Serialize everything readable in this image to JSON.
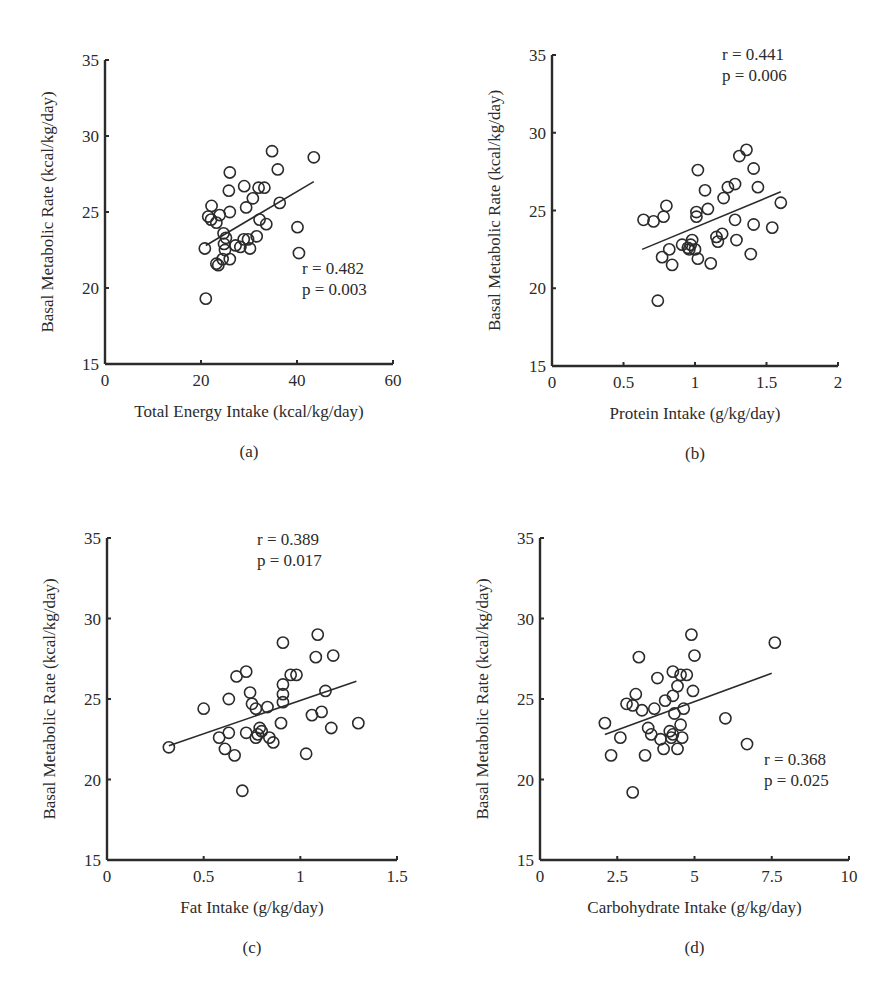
{
  "figure": {
    "panels": [
      {
        "id": "a",
        "label": "(a)",
        "xlabel": "Total Energy Intake (kcal/kg/day)",
        "ylabel": "Basal Metabolic Rate (kcal/kg/day)",
        "stats_r": "r = 0.482",
        "stats_p": "p = 0.003"
      },
      {
        "id": "b",
        "label": "(b)",
        "xlabel": "Protein Intake (g/kg/day)",
        "ylabel": "Basal Metabolic Rate (kcal/kg/day)",
        "stats_r": "r = 0.441",
        "stats_p": "p = 0.006"
      },
      {
        "id": "c",
        "label": "(c)",
        "xlabel": "Fat Intake (g/kg/day)",
        "ylabel": "Basal Metabolic Rate (kcal/kg/day)",
        "stats_r": "r = 0.389",
        "stats_p": "p = 0.017"
      },
      {
        "id": "d",
        "label": "(d)",
        "xlabel": "Carbohydrate Intake (g/kg/day)",
        "ylabel": "Basal Metabolic Rate (kcal/kg/day)",
        "stats_r": "r  = 0.368",
        "stats_p": "p = 0.025"
      }
    ]
  },
  "chart_data": [
    {
      "type": "scatter",
      "title": "(a)",
      "xlabel": "Total Energy Intake (kcal/kg/day)",
      "ylabel": "Basal Metabolic Rate (kcal/kg/day)",
      "xlim": [
        0,
        60
      ],
      "ylim": [
        15,
        35
      ],
      "xticks": [
        0,
        20,
        40,
        60
      ],
      "yticks": [
        15,
        20,
        25,
        30,
        35
      ],
      "xtick_labels": [
        "0",
        "20",
        "40",
        "60"
      ],
      "grid": false,
      "annotation": {
        "r": "r = 0.482",
        "p": "p = 0.003",
        "position": "lower-right"
      },
      "regression_line": [
        [
          21,
          22.8
        ],
        [
          43.5,
          27.0
        ]
      ],
      "points": [
        [
          34.8,
          29.0
        ],
        [
          43.5,
          28.6
        ],
        [
          26.0,
          27.6
        ],
        [
          36.0,
          27.8
        ],
        [
          29.0,
          26.7
        ],
        [
          25.8,
          26.4
        ],
        [
          32.0,
          26.6
        ],
        [
          33.2,
          26.6
        ],
        [
          30.8,
          25.9
        ],
        [
          36.4,
          25.6
        ],
        [
          29.4,
          25.3
        ],
        [
          22.2,
          25.4
        ],
        [
          26.0,
          25.0
        ],
        [
          21.5,
          24.7
        ],
        [
          22.1,
          24.5
        ],
        [
          23.2,
          24.3
        ],
        [
          23.9,
          24.8
        ],
        [
          32.2,
          24.5
        ],
        [
          33.6,
          24.2
        ],
        [
          40.1,
          24.0
        ],
        [
          24.7,
          23.6
        ],
        [
          25.2,
          23.3
        ],
        [
          31.6,
          23.4
        ],
        [
          20.8,
          22.6
        ],
        [
          24.8,
          22.9
        ],
        [
          27.2,
          22.8
        ],
        [
          28.2,
          22.7
        ],
        [
          28.9,
          23.2
        ],
        [
          29.8,
          23.2
        ],
        [
          30.2,
          22.6
        ],
        [
          25.0,
          22.5
        ],
        [
          40.4,
          22.3
        ],
        [
          24.5,
          21.9
        ],
        [
          26.0,
          21.9
        ],
        [
          23.2,
          21.6
        ],
        [
          23.6,
          21.5
        ],
        [
          21.0,
          19.3
        ]
      ]
    },
    {
      "type": "scatter",
      "title": "(b)",
      "xlabel": "Protein Intake (g/kg/day)",
      "ylabel": "Basal Metabolic Rate (kcal/kg/day)",
      "xlim": [
        0,
        2
      ],
      "ylim": [
        15,
        35
      ],
      "xticks": [
        0,
        0.5,
        1,
        1.5,
        2
      ],
      "yticks": [
        15,
        20,
        25,
        30,
        35
      ],
      "xtick_labels": [
        "0",
        "0.5",
        "1",
        "1.5",
        "2"
      ],
      "grid": false,
      "annotation": {
        "r": "r = 0.441",
        "p": "p = 0.006",
        "position": "upper-right"
      },
      "regression_line": [
        [
          0.63,
          22.5
        ],
        [
          1.6,
          26.2
        ]
      ],
      "points": [
        [
          0.64,
          24.4
        ],
        [
          0.71,
          24.3
        ],
        [
          0.78,
          24.6
        ],
        [
          0.8,
          25.3
        ],
        [
          0.74,
          19.2
        ],
        [
          0.77,
          22.0
        ],
        [
          0.82,
          22.5
        ],
        [
          0.84,
          21.5
        ],
        [
          0.91,
          22.8
        ],
        [
          0.95,
          22.6
        ],
        [
          0.97,
          22.8
        ],
        [
          0.98,
          23.1
        ],
        [
          1.0,
          22.5
        ],
        [
          1.02,
          21.9
        ],
        [
          0.96,
          22.5
        ],
        [
          1.02,
          27.6
        ],
        [
          1.01,
          24.9
        ],
        [
          1.01,
          24.6
        ],
        [
          1.07,
          26.3
        ],
        [
          1.09,
          25.1
        ],
        [
          1.11,
          21.6
        ],
        [
          1.15,
          23.3
        ],
        [
          1.16,
          23.0
        ],
        [
          1.19,
          23.5
        ],
        [
          1.2,
          25.8
        ],
        [
          1.23,
          26.5
        ],
        [
          1.28,
          26.7
        ],
        [
          1.28,
          24.4
        ],
        [
          1.29,
          23.1
        ],
        [
          1.31,
          28.5
        ],
        [
          1.36,
          28.9
        ],
        [
          1.41,
          27.7
        ],
        [
          1.41,
          24.1
        ],
        [
          1.44,
          26.5
        ],
        [
          1.39,
          22.2
        ],
        [
          1.54,
          23.9
        ],
        [
          1.6,
          25.5
        ]
      ]
    },
    {
      "type": "scatter",
      "title": "(c)",
      "xlabel": "Fat Intake (g/kg/day)",
      "ylabel": "Basal Metabolic Rate (kcal/kg/day)",
      "xlim": [
        0,
        1.5
      ],
      "ylim": [
        15,
        35
      ],
      "xticks": [
        0,
        0.5,
        1,
        1.5
      ],
      "yticks": [
        15,
        20,
        25,
        30,
        35
      ],
      "xtick_labels": [
        "0",
        "0.5",
        "1",
        "1.5"
      ],
      "grid": false,
      "annotation": {
        "r": "r = 0.389",
        "p": "p = 0.017",
        "position": "upper-right"
      },
      "regression_line": [
        [
          0.32,
          22.1
        ],
        [
          1.29,
          26.1
        ]
      ],
      "points": [
        [
          0.32,
          22.0
        ],
        [
          0.5,
          24.4
        ],
        [
          0.58,
          22.6
        ],
        [
          0.63,
          22.9
        ],
        [
          0.61,
          21.9
        ],
        [
          0.63,
          25.0
        ],
        [
          0.66,
          21.5
        ],
        [
          0.67,
          26.4
        ],
        [
          0.72,
          26.7
        ],
        [
          0.7,
          19.3
        ],
        [
          0.72,
          22.9
        ],
        [
          0.74,
          25.4
        ],
        [
          0.75,
          24.7
        ],
        [
          0.77,
          24.4
        ],
        [
          0.77,
          22.6
        ],
        [
          0.78,
          22.8
        ],
        [
          0.79,
          23.2
        ],
        [
          0.8,
          23.0
        ],
        [
          0.83,
          24.5
        ],
        [
          0.84,
          22.6
        ],
        [
          0.86,
          22.3
        ],
        [
          0.9,
          23.5
        ],
        [
          0.91,
          24.8
        ],
        [
          0.91,
          25.3
        ],
        [
          0.91,
          25.9
        ],
        [
          0.91,
          28.5
        ],
        [
          0.95,
          26.5
        ],
        [
          0.98,
          26.5
        ],
        [
          1.03,
          21.6
        ],
        [
          1.06,
          24.0
        ],
        [
          1.08,
          27.6
        ],
        [
          1.09,
          29.0
        ],
        [
          1.11,
          24.2
        ],
        [
          1.13,
          25.5
        ],
        [
          1.16,
          23.2
        ],
        [
          1.17,
          27.7
        ],
        [
          1.3,
          23.5
        ]
      ]
    },
    {
      "type": "scatter",
      "title": "(d)",
      "xlabel": "Carbohydrate Intake (g/kg/day)",
      "ylabel": "Basal Metabolic Rate (kcal/kg/day)",
      "xlim": [
        0,
        10
      ],
      "ylim": [
        15,
        35
      ],
      "xticks": [
        0,
        2.5,
        5,
        7.5,
        10
      ],
      "yticks": [
        15,
        20,
        25,
        30,
        35
      ],
      "xtick_labels": [
        "0",
        "2.5",
        "5",
        "7.5",
        "10"
      ],
      "grid": false,
      "annotation": {
        "r": "r  = 0.368",
        "p": "p = 0.025",
        "position": "lower-right"
      },
      "regression_line": [
        [
          2.1,
          22.8
        ],
        [
          7.5,
          26.6
        ]
      ],
      "points": [
        [
          2.1,
          23.5
        ],
        [
          2.3,
          21.5
        ],
        [
          2.6,
          22.6
        ],
        [
          2.8,
          24.7
        ],
        [
          3.0,
          24.6
        ],
        [
          3.0,
          19.2
        ],
        [
          3.1,
          25.3
        ],
        [
          3.2,
          27.6
        ],
        [
          3.3,
          24.3
        ],
        [
          3.4,
          21.5
        ],
        [
          3.5,
          23.2
        ],
        [
          3.6,
          22.8
        ],
        [
          3.7,
          24.4
        ],
        [
          3.8,
          26.3
        ],
        [
          3.9,
          22.5
        ],
        [
          4.0,
          21.9
        ],
        [
          4.05,
          24.9
        ],
        [
          4.2,
          23.0
        ],
        [
          4.3,
          22.8
        ],
        [
          4.25,
          22.6
        ],
        [
          4.3,
          25.2
        ],
        [
          4.3,
          26.7
        ],
        [
          4.35,
          24.1
        ],
        [
          4.45,
          25.8
        ],
        [
          4.45,
          21.9
        ],
        [
          4.55,
          26.5
        ],
        [
          4.6,
          22.6
        ],
        [
          4.55,
          23.4
        ],
        [
          4.65,
          24.4
        ],
        [
          4.75,
          26.5
        ],
        [
          4.9,
          29.0
        ],
        [
          4.95,
          25.5
        ],
        [
          5.0,
          27.7
        ],
        [
          6.0,
          23.8
        ],
        [
          6.7,
          22.2
        ],
        [
          7.6,
          28.5
        ]
      ]
    }
  ]
}
